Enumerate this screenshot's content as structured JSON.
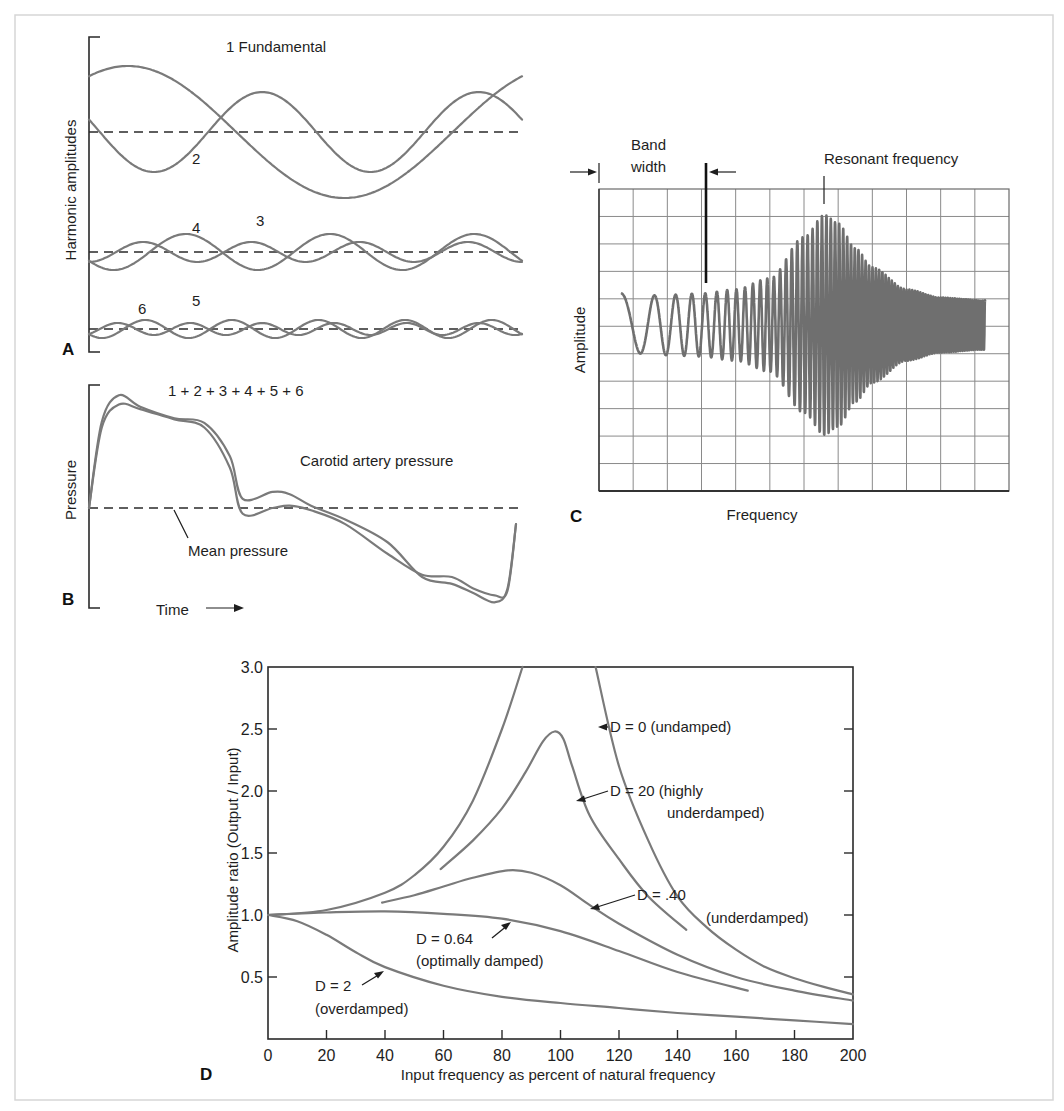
{
  "figure": {
    "panels": {
      "A": {
        "letter": "A",
        "ylabel": "Harmonic amplitudes",
        "title": "1 Fundamental",
        "labels": {
          "h2": "2",
          "h3": "3",
          "h4": "4",
          "h5": "5",
          "h6": "6"
        }
      },
      "B": {
        "letter": "B",
        "ylabel": "Pressure",
        "title": "1 + 2 + 3 + 4 + 5 + 6",
        "curve_label": "Carotid artery pressure",
        "mean_label": "Mean pressure",
        "xlabel": "Time"
      },
      "C": {
        "letter": "C",
        "ylabel": "Amplitude",
        "xlabel": "Frequency",
        "bandwidth_label_1": "Band",
        "bandwidth_label_2": "width",
        "resonant_label": "Resonant frequency"
      },
      "D": {
        "letter": "D",
        "ylabel": "Amplitude ratio (Output / Input)",
        "xlabel": "Input frequency as percent of natural frequency",
        "xticks": [
          "0",
          "20",
          "40",
          "60",
          "80",
          "100",
          "120",
          "140",
          "160",
          "180",
          "200"
        ],
        "yticks": [
          "0.5",
          "1.0",
          "1.5",
          "2.0",
          "2.5",
          "3.0"
        ],
        "annotations": {
          "d0": "D = 0 (undamped)",
          "d20_1": "D = 20 (highly",
          "d20_2": "underdamped)",
          "d40_1": "D = .40",
          "d40_2": "(underdamped)",
          "d064_1": "D = 0.64",
          "d064_2": "(optimally damped)",
          "d2_1": "D = 2",
          "d2_2": "(overdamped)"
        }
      }
    }
  },
  "chart_data": [
    {
      "panel": "A",
      "type": "line",
      "title": "1 Fundamental",
      "xlabel": "",
      "ylabel": "Harmonic amplitudes",
      "series": [
        {
          "name": "1 (Fundamental)",
          "group": "upper",
          "relative_amplitude": 1.0,
          "cycles_shown": 1.0
        },
        {
          "name": "2",
          "group": "upper",
          "relative_amplitude": 0.55,
          "cycles_shown": 2.0
        },
        {
          "name": "3",
          "group": "middle",
          "relative_amplitude": 0.22,
          "cycles_shown": 3.0
        },
        {
          "name": "4",
          "group": "middle",
          "relative_amplitude": 0.12,
          "cycles_shown": 4.0
        },
        {
          "name": "5",
          "group": "lower",
          "relative_amplitude": 0.11,
          "cycles_shown": 5.0
        },
        {
          "name": "6",
          "group": "lower",
          "relative_amplitude": 0.07,
          "cycles_shown": 6.0
        }
      ],
      "baselines": [
        "dashed zero line per group"
      ]
    },
    {
      "panel": "B",
      "type": "line",
      "title": "1 + 2 + 3 + 4 + 5 + 6",
      "xlabel": "Time",
      "ylabel": "Pressure",
      "series": [
        {
          "name": "Carotid artery pressure (measured)",
          "x": [
            0,
            0.03,
            0.07,
            0.12,
            0.2,
            0.27,
            0.33,
            0.36,
            0.43,
            0.47,
            0.52,
            0.6,
            0.7,
            0.78,
            0.85,
            0.9,
            0.95,
            0.98,
            1.0
          ],
          "y": [
            0.0,
            0.75,
            0.98,
            0.88,
            0.78,
            0.74,
            0.45,
            0.08,
            0.14,
            0.12,
            0.02,
            -0.1,
            -0.3,
            -0.6,
            -0.66,
            -0.74,
            -0.82,
            -0.7,
            -0.14
          ]
        },
        {
          "name": "Sum of harmonics 1-6",
          "x": [
            0,
            0.03,
            0.07,
            0.12,
            0.2,
            0.27,
            0.33,
            0.36,
            0.43,
            0.47,
            0.52,
            0.6,
            0.7,
            0.78,
            0.85,
            0.9,
            0.95,
            0.98,
            1.0
          ],
          "y": [
            0.0,
            0.7,
            0.9,
            0.86,
            0.77,
            0.7,
            0.35,
            -0.05,
            0.0,
            0.02,
            -0.02,
            -0.14,
            -0.4,
            -0.58,
            -0.6,
            -0.7,
            -0.76,
            -0.72,
            -0.14
          ]
        }
      ],
      "reference_lines": [
        {
          "name": "Mean pressure",
          "y": 0,
          "style": "dashed"
        }
      ]
    },
    {
      "panel": "C",
      "type": "line",
      "title": "",
      "xlabel": "Frequency",
      "ylabel": "Amplitude",
      "grid": {
        "columns": 12,
        "rows": 11
      },
      "series": [
        {
          "name": "Frequency sweep response",
          "description": "Chirp oscillation whose amplitude grows to a maximum at the resonant frequency (~6.5 of 12 grid divisions) then decays",
          "envelope_x_div": [
            0.6,
            2.0,
            3.0,
            4.0,
            5.0,
            6.0,
            6.6,
            7.0,
            7.5,
            8.0,
            9.0,
            10.0,
            11.2
          ],
          "envelope_half_amplitude_div": [
            1.0,
            1.1,
            1.15,
            1.3,
            1.7,
            3.2,
            4.0,
            3.7,
            2.8,
            2.1,
            1.3,
            1.0,
            0.9
          ]
        }
      ],
      "annotations": [
        "Band width (between arrows, ~0 to 3 grid divisions)",
        "Resonant frequency (~6.5 divisions)"
      ]
    },
    {
      "panel": "D",
      "type": "line",
      "title": "",
      "xlabel": "Input frequency as percent of natural frequency",
      "ylabel": "Amplitude ratio (Output / Input)",
      "xlim": [
        0,
        200
      ],
      "ylim": [
        0,
        3.0
      ],
      "xticks": [
        0,
        20,
        40,
        60,
        80,
        100,
        120,
        140,
        160,
        180,
        200
      ],
      "yticks": [
        0.5,
        1.0,
        1.5,
        2.0,
        2.5,
        3.0
      ],
      "grid": false,
      "series": [
        {
          "name": "D = 0 (undamped)",
          "segments": [
            {
              "x": [
                0,
                20,
                40,
                50,
                60,
                70,
                80,
                87
              ],
              "y": [
                1.0,
                1.04,
                1.18,
                1.32,
                1.55,
                1.92,
                2.5,
                3.0
              ]
            },
            {
              "x": [
                112,
                120,
                130,
                140,
                150,
                160,
                170,
                180,
                190,
                200
              ],
              "y": [
                3.0,
                2.2,
                1.6,
                1.15,
                0.9,
                0.72,
                0.58,
                0.49,
                0.42,
                0.36
              ]
            }
          ]
        },
        {
          "name": "D = 20 (highly underdamped)",
          "x": [
            59,
            70,
            80,
            88,
            94,
            98,
            101,
            104,
            110,
            120,
            130,
            143
          ],
          "y": [
            1.37,
            1.6,
            1.86,
            2.15,
            2.4,
            2.48,
            2.42,
            2.2,
            1.8,
            1.45,
            1.15,
            0.88
          ]
        },
        {
          "name": "D = .40 (underdamped)",
          "x": [
            39,
            50,
            60,
            70,
            82,
            90,
            100,
            110,
            120,
            140,
            160,
            180,
            200
          ],
          "y": [
            1.1,
            1.16,
            1.23,
            1.3,
            1.36,
            1.34,
            1.24,
            1.08,
            0.93,
            0.68,
            0.5,
            0.39,
            0.31
          ]
        },
        {
          "name": "D = 0.64 (optimally damped)",
          "x": [
            0,
            20,
            40,
            60,
            80,
            100,
            120,
            140,
            164
          ],
          "y": [
            1.0,
            1.02,
            1.03,
            1.01,
            0.97,
            0.87,
            0.71,
            0.54,
            0.39
          ]
        },
        {
          "name": "D = 2 (overdamped)",
          "x": [
            0,
            10,
            20,
            30,
            40,
            60,
            80,
            100,
            120,
            140,
            160,
            180,
            200
          ],
          "y": [
            1.0,
            0.95,
            0.84,
            0.7,
            0.58,
            0.43,
            0.34,
            0.29,
            0.25,
            0.21,
            0.18,
            0.15,
            0.12
          ]
        }
      ]
    }
  ]
}
